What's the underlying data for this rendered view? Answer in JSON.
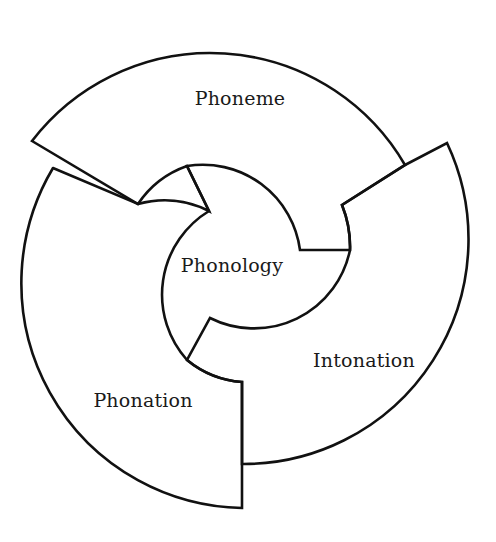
{
  "diagram": {
    "type": "concentric-segmented-ring",
    "center": {
      "label": "Phonology"
    },
    "segments": [
      {
        "label": "Phoneme",
        "position": "top"
      },
      {
        "label": "Intonation",
        "position": "right"
      },
      {
        "label": "Phonation",
        "position": "left-bottom"
      }
    ],
    "colors": {
      "stroke": "#111111",
      "fill": "#ffffff",
      "text": "#1a1a1a"
    }
  }
}
